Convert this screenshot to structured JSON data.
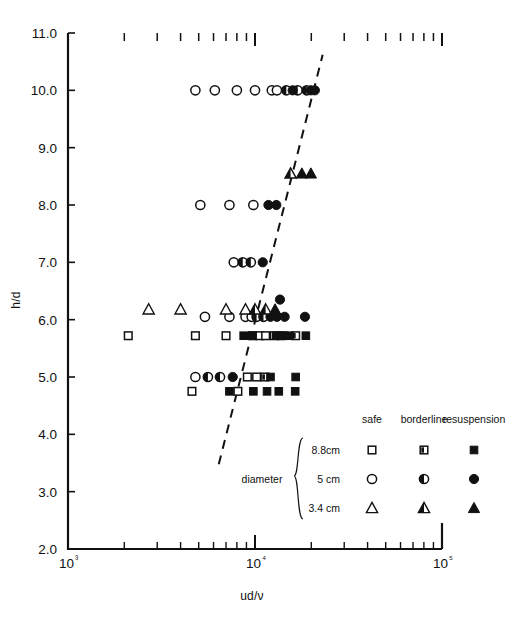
{
  "chart_data": {
    "type": "scatter",
    "title": "",
    "xlabel": "ud/ν",
    "ylabel": "h/d",
    "xscale": "log",
    "yscale": "linear",
    "xlim": [
      1000,
      100000
    ],
    "ylim": [
      2.0,
      11.0
    ],
    "grid": false,
    "x_tick_labels": [
      "10³",
      "10⁴",
      "10⁵"
    ],
    "x_tick_values": [
      1000,
      10000,
      100000
    ],
    "y_tick_labels": [
      "2.0",
      "3.0",
      "4.0",
      "5.0",
      "6.0",
      "7.0",
      "8.0",
      "9.0",
      "10.0",
      "11.0"
    ],
    "y_tick_values": [
      2.0,
      3.0,
      4.0,
      5.0,
      6.0,
      7.0,
      8.0,
      9.0,
      10.0,
      11.0
    ],
    "legend_position": "lower-right",
    "trendline": {
      "style": "dashed",
      "x_start": 6400,
      "y_start": 3.48,
      "x_end": 23000,
      "y_end": 10.62
    },
    "series": [
      {
        "name": "8.8 cm safe",
        "marker": "square-open",
        "diameter": "8.8cm",
        "state": "safe",
        "points": [
          [
            2100,
            5.72
          ],
          [
            4800,
            5.72
          ],
          [
            7000,
            5.72
          ],
          [
            9700,
            5.72
          ],
          [
            10600,
            5.72
          ],
          [
            11400,
            5.72
          ],
          [
            4600,
            4.75
          ],
          [
            8100,
            4.75
          ],
          [
            9100,
            5.0
          ],
          [
            10200,
            5.0
          ],
          [
            12700,
            5.72
          ]
        ]
      },
      {
        "name": "8.8 cm borderline",
        "marker": "square-half",
        "diameter": "8.8cm",
        "state": "borderline",
        "points": [
          [
            13800,
            5.72
          ],
          [
            16500,
            5.72
          ],
          [
            11300,
            5.0
          ]
        ]
      },
      {
        "name": "8.8 cm resuspension",
        "marker": "square-filled",
        "diameter": "8.8cm",
        "state": "resuspension",
        "points": [
          [
            8700,
            5.72
          ],
          [
            9700,
            5.72
          ],
          [
            13000,
            5.72
          ],
          [
            14300,
            5.72
          ],
          [
            15300,
            5.72
          ],
          [
            18700,
            5.72
          ],
          [
            7300,
            4.75
          ],
          [
            9800,
            4.75
          ],
          [
            11600,
            4.75
          ],
          [
            13400,
            4.75
          ],
          [
            16400,
            4.75
          ],
          [
            12100,
            5.0
          ],
          [
            16500,
            5.0
          ]
        ]
      },
      {
        "name": "5 cm safe",
        "marker": "circle-open",
        "diameter": "5cm",
        "state": "safe",
        "points": [
          [
            4800,
            10.0
          ],
          [
            6100,
            10.0
          ],
          [
            8000,
            10.0
          ],
          [
            10000,
            10.0
          ],
          [
            12300,
            10.0
          ],
          [
            13100,
            10.0
          ],
          [
            5100,
            8.0
          ],
          [
            7300,
            8.0
          ],
          [
            9800,
            8.0
          ],
          [
            7700,
            7.0
          ],
          [
            5400,
            6.05
          ],
          [
            7300,
            6.05
          ],
          [
            8900,
            6.05
          ],
          [
            9600,
            6.05
          ],
          [
            4800,
            5.0
          ]
        ]
      },
      {
        "name": "5 cm borderline",
        "marker": "circle-half",
        "diameter": "5cm",
        "state": "borderline",
        "points": [
          [
            14700,
            10.0
          ],
          [
            16900,
            10.0
          ],
          [
            18900,
            10.0
          ],
          [
            8600,
            7.0
          ],
          [
            9500,
            7.0
          ],
          [
            10200,
            6.05
          ],
          [
            11100,
            6.05
          ],
          [
            5600,
            5.0
          ],
          [
            6500,
            5.0
          ]
        ]
      },
      {
        "name": "5 cm resuspension",
        "marker": "circle-filled",
        "diameter": "5cm",
        "state": "resuspension",
        "points": [
          [
            15900,
            10.0
          ],
          [
            19900,
            10.0
          ],
          [
            20900,
            10.0
          ],
          [
            11800,
            8.0
          ],
          [
            13000,
            8.0
          ],
          [
            11000,
            7.0
          ],
          [
            12100,
            6.05
          ],
          [
            13100,
            6.05
          ],
          [
            14400,
            6.05
          ],
          [
            18500,
            6.05
          ],
          [
            13600,
            6.35
          ],
          [
            7600,
            5.0
          ]
        ]
      },
      {
        "name": "3.4 cm safe",
        "marker": "triangle-open",
        "diameter": "3.4 cm",
        "state": "safe",
        "points": [
          [
            2700,
            6.18
          ],
          [
            4000,
            6.18
          ],
          [
            7000,
            6.18
          ],
          [
            8900,
            6.18
          ]
        ]
      },
      {
        "name": "3.4 cm borderline",
        "marker": "triangle-half",
        "diameter": "3.4 cm",
        "state": "borderline",
        "points": [
          [
            15500,
            8.55
          ],
          [
            10000,
            6.18
          ],
          [
            11400,
            6.18
          ]
        ]
      },
      {
        "name": "3.4 cm resuspension",
        "marker": "triangle-filled",
        "diameter": "3.4 cm",
        "state": "resuspension",
        "points": [
          [
            17800,
            8.55
          ],
          [
            19900,
            8.55
          ],
          [
            12800,
            6.18
          ]
        ]
      }
    ]
  },
  "legend": {
    "group_label": "diameter",
    "column_headers": [
      "safe",
      "borderline",
      "resuspension"
    ],
    "rows": [
      {
        "label": "8.8cm",
        "shape": "square"
      },
      {
        "label": "5 cm",
        "shape": "circle"
      },
      {
        "label": "3.4 cm",
        "shape": "triangle"
      }
    ]
  }
}
